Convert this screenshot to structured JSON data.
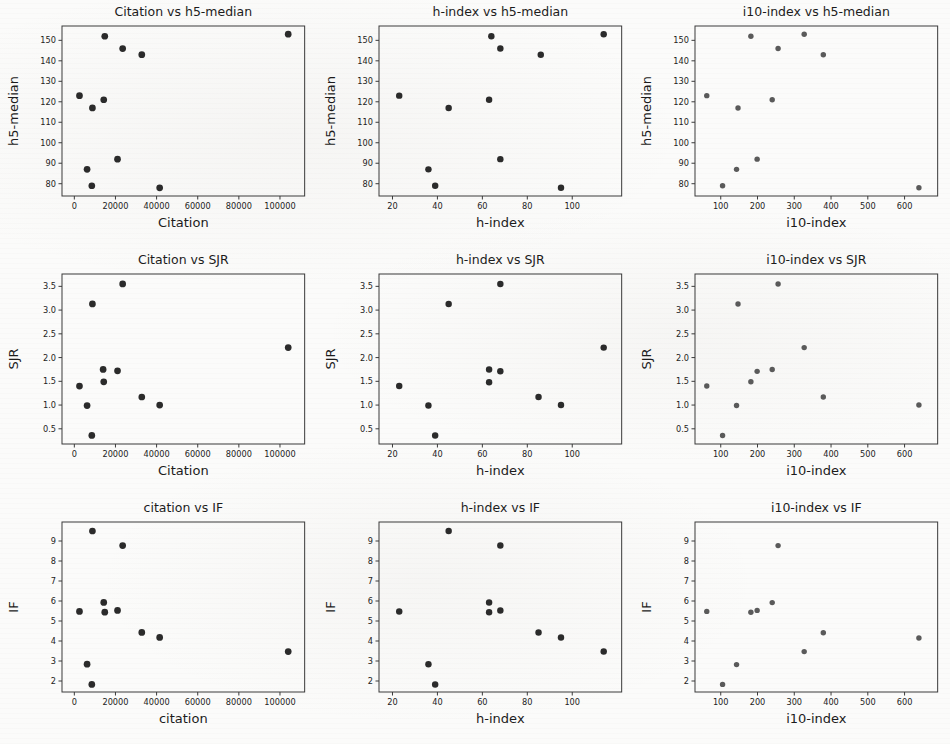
{
  "figure": {
    "name": "scatter-matrix-journal-metrics",
    "background_color": "#fbfbfa",
    "marker_color": "#2b2b2b",
    "marker_color_light": "#5a5a5a",
    "axis_color": "#3a3a3a",
    "rows": 3,
    "cols": 3
  },
  "chart_data": [
    {
      "type": "scatter",
      "title": "Citation vs h5-median",
      "xlabel": "Citation",
      "ylabel": "h5-median",
      "xlim": [
        -6000,
        112000
      ],
      "ylim": [
        74,
        157
      ],
      "xticks": [
        0,
        20000,
        40000,
        60000,
        80000,
        100000
      ],
      "xticklabels": [
        "0",
        "20000",
        "40000",
        "60000",
        "80000",
        "100000"
      ],
      "yticks": [
        80,
        90,
        100,
        110,
        120,
        130,
        140,
        150
      ],
      "yticklabels": [
        "80",
        "90",
        "100",
        "110",
        "120",
        "130",
        "140",
        "150"
      ],
      "grid": false,
      "legend": "none",
      "marker_size": 5.2,
      "marker_color": "#2b2b2b",
      "points": [
        {
          "x": 2500,
          "y": 123
        },
        {
          "x": 6200,
          "y": 87
        },
        {
          "x": 8500,
          "y": 79
        },
        {
          "x": 8800,
          "y": 117
        },
        {
          "x": 14300,
          "y": 121
        },
        {
          "x": 14800,
          "y": 152
        },
        {
          "x": 21000,
          "y": 92
        },
        {
          "x": 23500,
          "y": 146
        },
        {
          "x": 32800,
          "y": 143
        },
        {
          "x": 41500,
          "y": 78
        },
        {
          "x": 104000,
          "y": 153
        }
      ]
    },
    {
      "type": "scatter",
      "title": "h-index vs h5-median",
      "xlabel": "h-index",
      "ylabel": "h5-median",
      "xlim": [
        14,
        122
      ],
      "ylim": [
        74,
        157
      ],
      "xticks": [
        20,
        40,
        60,
        80,
        100
      ],
      "xticklabels": [
        "20",
        "40",
        "60",
        "80",
        "100"
      ],
      "yticks": [
        80,
        90,
        100,
        110,
        120,
        130,
        140,
        150
      ],
      "yticklabels": [
        "80",
        "90",
        "100",
        "110",
        "120",
        "130",
        "140",
        "150"
      ],
      "grid": false,
      "legend": "none",
      "marker_size": 5.0,
      "marker_color": "#2b2b2b",
      "points": [
        {
          "x": 23,
          "y": 123
        },
        {
          "x": 36,
          "y": 87
        },
        {
          "x": 39,
          "y": 79
        },
        {
          "x": 45,
          "y": 117
        },
        {
          "x": 63,
          "y": 121
        },
        {
          "x": 64,
          "y": 152
        },
        {
          "x": 68,
          "y": 92
        },
        {
          "x": 68,
          "y": 146
        },
        {
          "x": 86,
          "y": 143
        },
        {
          "x": 95,
          "y": 78
        },
        {
          "x": 114,
          "y": 153
        }
      ]
    },
    {
      "type": "scatter",
      "title": "i10-index vs h5-median",
      "xlabel": "i10-index",
      "ylabel": "h5-median",
      "xlim": [
        30,
        690
      ],
      "ylim": [
        74,
        157
      ],
      "xticks": [
        100,
        200,
        300,
        400,
        500,
        600
      ],
      "xticklabels": [
        "100",
        "200",
        "300",
        "400",
        "500",
        "600"
      ],
      "yticks": [
        80,
        90,
        100,
        110,
        120,
        130,
        140,
        150
      ],
      "yticklabels": [
        "80",
        "90",
        "100",
        "110",
        "120",
        "130",
        "140",
        "150"
      ],
      "grid": false,
      "legend": "none",
      "marker_size": 4.2,
      "marker_color": "#5a5a5a",
      "points": [
        {
          "x": 62,
          "y": 123
        },
        {
          "x": 105,
          "y": 79
        },
        {
          "x": 143,
          "y": 87
        },
        {
          "x": 147,
          "y": 117
        },
        {
          "x": 182,
          "y": 152
        },
        {
          "x": 199,
          "y": 92
        },
        {
          "x": 240,
          "y": 121
        },
        {
          "x": 256,
          "y": 146
        },
        {
          "x": 327,
          "y": 153
        },
        {
          "x": 379,
          "y": 143
        },
        {
          "x": 639,
          "y": 78
        }
      ]
    },
    {
      "type": "scatter",
      "title": "Citation vs SJR",
      "xlabel": "Citation",
      "ylabel": "SJR",
      "xlim": [
        -6000,
        112000
      ],
      "ylim": [
        0.18,
        3.76
      ],
      "xticks": [
        0,
        20000,
        40000,
        60000,
        80000,
        100000
      ],
      "xticklabels": [
        "0",
        "20000",
        "40000",
        "60000",
        "80000",
        "100000"
      ],
      "yticks": [
        0.5,
        1.0,
        1.5,
        2.0,
        2.5,
        3.0,
        3.5
      ],
      "yticklabels": [
        "0.5",
        "1.0",
        "1.5",
        "2.0",
        "2.5",
        "3.0",
        "3.5"
      ],
      "grid": false,
      "legend": "none",
      "marker_size": 5.2,
      "marker_color": "#2b2b2b",
      "points": [
        {
          "x": 2500,
          "y": 1.4
        },
        {
          "x": 6200,
          "y": 0.99
        },
        {
          "x": 8500,
          "y": 0.36
        },
        {
          "x": 8800,
          "y": 3.13
        },
        {
          "x": 14000,
          "y": 1.75
        },
        {
          "x": 14300,
          "y": 1.49
        },
        {
          "x": 21000,
          "y": 1.72
        },
        {
          "x": 23500,
          "y": 3.55
        },
        {
          "x": 32800,
          "y": 1.17
        },
        {
          "x": 41500,
          "y": 1.0
        },
        {
          "x": 104000,
          "y": 2.21
        }
      ]
    },
    {
      "type": "scatter",
      "title": "h-index vs SJR",
      "xlabel": "h-index",
      "ylabel": "SJR",
      "xlim": [
        14,
        122
      ],
      "ylim": [
        0.18,
        3.76
      ],
      "xticks": [
        20,
        40,
        60,
        80,
        100
      ],
      "xticklabels": [
        "20",
        "40",
        "60",
        "80",
        "100"
      ],
      "yticks": [
        0.5,
        1.0,
        1.5,
        2.0,
        2.5,
        3.0,
        3.5
      ],
      "yticklabels": [
        "0.5",
        "1.0",
        "1.5",
        "2.0",
        "2.5",
        "3.0",
        "3.5"
      ],
      "grid": false,
      "legend": "none",
      "marker_size": 5.0,
      "marker_color": "#2b2b2b",
      "points": [
        {
          "x": 23,
          "y": 1.4
        },
        {
          "x": 36,
          "y": 0.99
        },
        {
          "x": 39,
          "y": 0.36
        },
        {
          "x": 45,
          "y": 3.13
        },
        {
          "x": 63,
          "y": 1.75
        },
        {
          "x": 63,
          "y": 1.48
        },
        {
          "x": 68,
          "y": 1.71
        },
        {
          "x": 68,
          "y": 3.55
        },
        {
          "x": 85,
          "y": 1.17
        },
        {
          "x": 95,
          "y": 1.0
        },
        {
          "x": 114,
          "y": 2.21
        }
      ]
    },
    {
      "type": "scatter",
      "title": "i10-index vs SJR",
      "xlabel": "i10-index",
      "ylabel": "SJR",
      "xlim": [
        30,
        690
      ],
      "ylim": [
        0.18,
        3.76
      ],
      "xticks": [
        100,
        200,
        300,
        400,
        500,
        600
      ],
      "xticklabels": [
        "100",
        "200",
        "300",
        "400",
        "500",
        "600"
      ],
      "yticks": [
        0.5,
        1.0,
        1.5,
        2.0,
        2.5,
        3.0,
        3.5
      ],
      "yticklabels": [
        "0.5",
        "1.0",
        "1.5",
        "2.0",
        "2.5",
        "3.0",
        "3.5"
      ],
      "grid": false,
      "legend": "none",
      "marker_size": 4.2,
      "marker_color": "#5a5a5a",
      "points": [
        {
          "x": 62,
          "y": 1.4
        },
        {
          "x": 105,
          "y": 0.36
        },
        {
          "x": 143,
          "y": 0.99
        },
        {
          "x": 147,
          "y": 3.13
        },
        {
          "x": 182,
          "y": 1.49
        },
        {
          "x": 199,
          "y": 1.71
        },
        {
          "x": 240,
          "y": 1.75
        },
        {
          "x": 256,
          "y": 3.55
        },
        {
          "x": 327,
          "y": 2.21
        },
        {
          "x": 379,
          "y": 1.17
        },
        {
          "x": 639,
          "y": 1.0
        }
      ]
    },
    {
      "type": "scatter",
      "title": "citation vs IF",
      "xlabel": "citation",
      "ylabel": "IF",
      "xlim": [
        -6000,
        112000
      ],
      "ylim": [
        1.45,
        9.95
      ],
      "xticks": [
        0,
        20000,
        40000,
        60000,
        80000,
        100000
      ],
      "xticklabels": [
        "0",
        "20000",
        "40000",
        "60000",
        "80000",
        "100000"
      ],
      "yticks": [
        2,
        3,
        4,
        5,
        6,
        7,
        8,
        9
      ],
      "yticklabels": [
        "2",
        "3",
        "4",
        "5",
        "6",
        "7",
        "8",
        "9"
      ],
      "grid": false,
      "legend": "none",
      "marker_size": 5.2,
      "marker_color": "#2b2b2b",
      "points": [
        {
          "x": 2500,
          "y": 5.48
        },
        {
          "x": 6200,
          "y": 2.84
        },
        {
          "x": 8500,
          "y": 1.83
        },
        {
          "x": 8800,
          "y": 9.5
        },
        {
          "x": 14300,
          "y": 5.93
        },
        {
          "x": 14800,
          "y": 5.44
        },
        {
          "x": 21000,
          "y": 5.53
        },
        {
          "x": 23500,
          "y": 8.77
        },
        {
          "x": 32800,
          "y": 4.43
        },
        {
          "x": 41500,
          "y": 4.18
        },
        {
          "x": 104000,
          "y": 3.47
        }
      ]
    },
    {
      "type": "scatter",
      "title": "h-index vs IF",
      "xlabel": "h-index",
      "ylabel": "IF",
      "xlim": [
        14,
        122
      ],
      "ylim": [
        1.45,
        9.95
      ],
      "xticks": [
        20,
        40,
        60,
        80,
        100
      ],
      "xticklabels": [
        "20",
        "40",
        "60",
        "80",
        "100"
      ],
      "yticks": [
        2,
        3,
        4,
        5,
        6,
        7,
        8,
        9
      ],
      "yticklabels": [
        "2",
        "3",
        "4",
        "5",
        "6",
        "7",
        "8",
        "9"
      ],
      "grid": false,
      "legend": "none",
      "marker_size": 5.0,
      "marker_color": "#2b2b2b",
      "points": [
        {
          "x": 23,
          "y": 5.48
        },
        {
          "x": 36,
          "y": 2.84
        },
        {
          "x": 39,
          "y": 1.83
        },
        {
          "x": 45,
          "y": 9.5
        },
        {
          "x": 63,
          "y": 5.93
        },
        {
          "x": 63,
          "y": 5.44
        },
        {
          "x": 68,
          "y": 5.53
        },
        {
          "x": 68,
          "y": 8.77
        },
        {
          "x": 85,
          "y": 4.43
        },
        {
          "x": 95,
          "y": 4.18
        },
        {
          "x": 114,
          "y": 3.47
        }
      ]
    },
    {
      "type": "scatter",
      "title": "i10-index vs IF",
      "xlabel": "i10-index",
      "ylabel": "IF",
      "xlim": [
        30,
        690
      ],
      "ylim": [
        1.45,
        9.95
      ],
      "xticks": [
        100,
        200,
        300,
        400,
        500,
        600
      ],
      "xticklabels": [
        "100",
        "200",
        "300",
        "400",
        "500",
        "600"
      ],
      "yticks": [
        2,
        3,
        4,
        5,
        6,
        7,
        8,
        9
      ],
      "yticklabels": [
        "2",
        "3",
        "4",
        "5",
        "6",
        "7",
        "8",
        "9"
      ],
      "grid": false,
      "legend": "none",
      "marker_size": 4.2,
      "marker_color": "#5a5a5a",
      "points": [
        {
          "x": 62,
          "y": 5.48
        },
        {
          "x": 105,
          "y": 1.83
        },
        {
          "x": 143,
          "y": 2.82
        },
        {
          "x": 182,
          "y": 5.44
        },
        {
          "x": 199,
          "y": 5.53
        },
        {
          "x": 240,
          "y": 5.92
        },
        {
          "x": 256,
          "y": 8.77
        },
        {
          "x": 327,
          "y": 3.47
        },
        {
          "x": 379,
          "y": 4.41
        },
        {
          "x": 639,
          "y": 4.15
        }
      ]
    }
  ]
}
